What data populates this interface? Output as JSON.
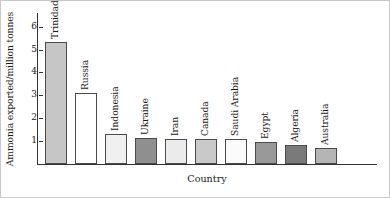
{
  "chart_data": {
    "type": "bar",
    "title": "",
    "xlabel": "Country",
    "ylabel": "Ammonia exported/million tonnes",
    "categories": [
      "Trinidad",
      "Russia",
      "Indonesia",
      "Ukraine",
      "Iran",
      "Canada",
      "Saudi Arabia",
      "Egypt",
      "Algeria",
      "Australia"
    ],
    "values": [
      5.35,
      3.1,
      1.3,
      1.15,
      1.1,
      1.1,
      1.1,
      0.95,
      0.85,
      0.7
    ],
    "bar_colors": [
      "#c6c6c6",
      "#ffffff",
      "#f0f0f0",
      "#8f8f8f",
      "#ebebeb",
      "#c9c9c9",
      "#fbfbfb",
      "#999999",
      "#7a7a7a",
      "#b5b5b5"
    ],
    "ylim": [
      0,
      6.6
    ],
    "yticks": [
      1,
      2,
      3,
      4,
      5,
      6
    ],
    "ytick_labels": [
      "1",
      "2",
      "3",
      "4",
      "5",
      "6"
    ],
    "grid": false,
    "legend": "none",
    "axis_color": "#333333",
    "bar_edge_color": "#4a4a4a"
  }
}
